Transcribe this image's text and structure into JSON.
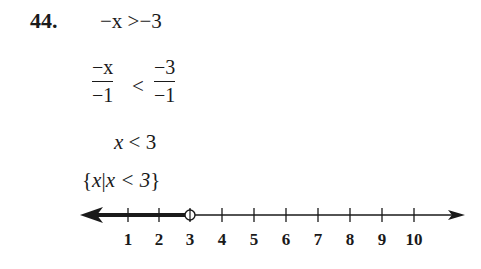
{
  "problem": {
    "number": "44.",
    "steps": [
      {
        "lhs": "−x",
        "op": ">",
        "rhs": "−3"
      },
      {
        "lhs_num": "−x",
        "lhs_den": "−1",
        "op": "<",
        "rhs_num": "−3",
        "rhs_den": "−1"
      },
      {
        "lhs": "x",
        "op": "<",
        "rhs": "3"
      }
    ],
    "set_notation": {
      "open": "{",
      "var": "x",
      "bar": "|",
      "condition": "x < 3",
      "close": "}"
    }
  },
  "number_line": {
    "ticks": [
      "1",
      "2",
      "3",
      "4",
      "5",
      "6",
      "7",
      "8",
      "9",
      "10"
    ],
    "open_circle_at": "3",
    "shaded_direction": "left"
  }
}
